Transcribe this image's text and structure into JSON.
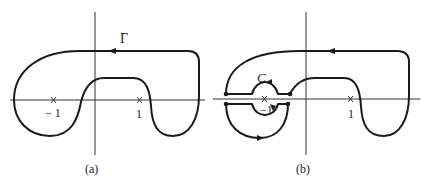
{
  "figure": {
    "panel_a": {
      "caption": "(a)",
      "contour_label": "Γ",
      "points": [
        {
          "label": "− 1",
          "marker": "x"
        },
        {
          "label": "1",
          "marker": "x"
        }
      ]
    },
    "panel_b": {
      "caption": "(b)",
      "small_circle_label": "C",
      "points": [
        {
          "label": "−1",
          "marker": "x"
        },
        {
          "label": "1",
          "marker": "x"
        }
      ]
    },
    "colors": {
      "stroke": "#1a1a1a",
      "axis": "#333333",
      "background": "#ffffff"
    }
  }
}
